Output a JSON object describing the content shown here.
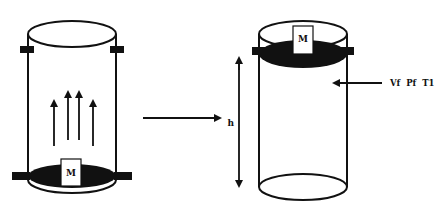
{
  "diagram": {
    "left_cylinder": {
      "piston_label": "M",
      "piston_position": "bottom",
      "arrows_up_count": 4
    },
    "transition_arrow": {
      "direction": "right"
    },
    "right_cylinder": {
      "piston_label": "M",
      "piston_position": "top",
      "height_label": "h",
      "state_label": "Vf  Pf  T1"
    },
    "colors": {
      "stroke": "#111111",
      "fill_dark": "#111111",
      "background": "#ffffff"
    }
  }
}
